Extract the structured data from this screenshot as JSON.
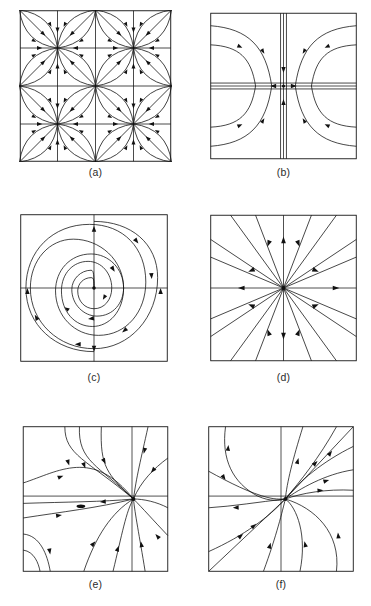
{
  "figure": {
    "kind": "phase-portrait-plate",
    "width": 371,
    "height": 606,
    "background": "#ffffff",
    "ink": "#111111",
    "panel_count": 6
  },
  "panels": [
    {
      "id": "a",
      "caption": "(a)",
      "portrait_type": "periodic-lattice-node-array",
      "description": "Doubly periodic array of nodes and saddles on a 2x2 cell grid with curved separatrices",
      "box": {
        "x": 18,
        "y": 10,
        "w": 155,
        "h": 152
      },
      "caption_y": 166
    },
    {
      "id": "b",
      "caption": "(b)",
      "portrait_type": "saddle",
      "description": "Saddle point at origin; hyperbolic trajectories, stable vertical axis, unstable horizontal axis",
      "box": {
        "x": 210,
        "y": 12,
        "w": 147,
        "h": 148
      },
      "caption_y": 166
    },
    {
      "id": "c",
      "caption": "(c)",
      "portrait_type": "stable-spiral",
      "description": "Stable spiral focus, square-rounded inward spiralling orbits",
      "box": {
        "x": 18,
        "y": 214,
        "w": 152,
        "h": 148
      },
      "caption_y": 371
    },
    {
      "id": "d",
      "caption": "(d)",
      "portrait_type": "star-node",
      "description": "Star node / proper node at origin with straight-line radial trajectories",
      "box": {
        "x": 210,
        "y": 214,
        "w": 147,
        "h": 148
      },
      "caption_y": 371
    },
    {
      "id": "e",
      "caption": "(e)",
      "portrait_type": "improper-node-offset",
      "description": "Improper node located right of centre, trajectories entering along a dominant direction",
      "box": {
        "x": 18,
        "y": 426,
        "w": 155,
        "h": 146
      },
      "caption_y": 578
    },
    {
      "id": "f",
      "caption": "(f)",
      "portrait_type": "degenerate-node",
      "description": "Degenerate (one-tangent-direction) node, all trajectories tangent to the diagonal",
      "box": {
        "x": 206,
        "y": 426,
        "w": 150,
        "h": 146
      },
      "caption_y": 578
    }
  ],
  "chart_data": {
    "type": "line",
    "title": "",
    "xlabel": "",
    "ylabel": "",
    "grid": false,
    "legend": "none",
    "panels": [
      {
        "label": "(a)",
        "system": "periodic lattice of alternating nodes and saddles",
        "critical_points": [
          {
            "x": -0.5,
            "y": 0.5,
            "kind": "node"
          },
          {
            "x": 0.5,
            "y": 0.5,
            "kind": "node"
          },
          {
            "x": -0.5,
            "y": -0.5,
            "kind": "node"
          },
          {
            "x": 0.5,
            "y": -0.5,
            "kind": "node"
          },
          {
            "x": 0.0,
            "y": 0.0,
            "kind": "saddle"
          }
        ],
        "flow_direction": "inward toward each node along curved petal separatrices"
      },
      {
        "label": "(b)",
        "system": "x' = x, y' = -y",
        "critical_points": [
          {
            "x": 0,
            "y": 0,
            "kind": "saddle"
          }
        ],
        "stable_manifold": "vertical axis (arrows toward origin)",
        "unstable_manifold": "horizontal axis (arrows away from origin)",
        "trajectory_count": 8
      },
      {
        "label": "(c)",
        "system": "stable spiral focus",
        "critical_points": [
          {
            "x": 0,
            "y": 0,
            "kind": "spiral-sink"
          }
        ],
        "rotation": "clockwise",
        "spiral_turns": 2.5,
        "trajectory_count": 2
      },
      {
        "label": "(d)",
        "system": "proper (star) node",
        "critical_points": [
          {
            "x": 0,
            "y": 0,
            "kind": "star-node"
          }
        ],
        "ray_count": 12,
        "flow_direction": "mixed: inward on diagonals, outward on axes"
      },
      {
        "label": "(e)",
        "system": "improper node, equilibrium offset to the right",
        "critical_points": [
          {
            "x": 0.48,
            "y": 0.02,
            "kind": "improper-node"
          }
        ],
        "trajectory_count": 11,
        "flow_direction": "inward"
      },
      {
        "label": "(f)",
        "system": "degenerate node with single eigendirection along the diagonal",
        "critical_points": [
          {
            "x": 0.05,
            "y": 0.0,
            "kind": "degenerate-node"
          }
        ],
        "trajectory_count": 12,
        "tangent_direction": "45 degree diagonal"
      }
    ]
  }
}
